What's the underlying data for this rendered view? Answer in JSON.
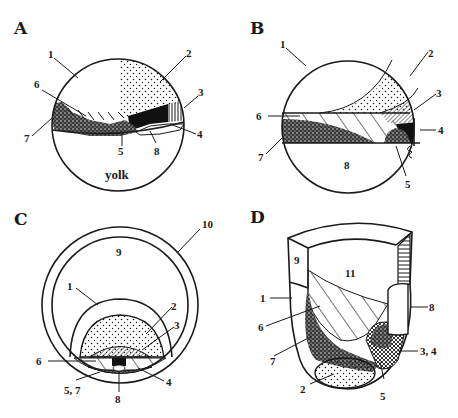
{
  "figure": {
    "panels": [
      {
        "id": "A",
        "letter": "A",
        "labels": {
          "l1": "1",
          "l2": "2",
          "l3": "3",
          "l4": "4",
          "l5": "5",
          "l6": "6",
          "l7": "7",
          "l8": "8",
          "yolk": "yolk"
        }
      },
      {
        "id": "B",
        "letter": "B",
        "labels": {
          "l1": "1",
          "l2": "2",
          "l3": "3",
          "l4": "4",
          "l5": "5",
          "l6": "6",
          "l7": "7",
          "l8": "8"
        }
      },
      {
        "id": "C",
        "letter": "C",
        "labels": {
          "l1": "1",
          "l2": "2",
          "l3": "3",
          "l4": "4",
          "l57": "5, 7",
          "l6": "6",
          "l8": "8",
          "l9": "9",
          "l10": "10"
        }
      },
      {
        "id": "D",
        "letter": "D",
        "labels": {
          "l1": "1",
          "l2": "2",
          "l34": "3, 4",
          "l5": "5",
          "l6": "6",
          "l7": "7",
          "l8": "8",
          "l9": "9",
          "l11": "11"
        }
      }
    ],
    "colors": {
      "ink": "#1a1a1a",
      "background": "#ffffff"
    }
  }
}
